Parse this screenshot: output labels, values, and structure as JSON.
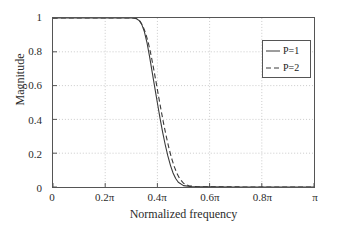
{
  "chart_data": {
    "type": "line",
    "title": "",
    "xlabel": "Normalized frequency",
    "ylabel": "Magnitude",
    "xlim": [
      0,
      1
    ],
    "ylim": [
      0,
      1
    ],
    "grid": true,
    "grid_style": "dotted",
    "legend_position": "upper right",
    "xticks": [
      0,
      0.2,
      0.4,
      0.6,
      0.8,
      1.0
    ],
    "xticklabels": [
      "0",
      "0.2π",
      "0.4π",
      "0.6π",
      "0.8π",
      "π"
    ],
    "yticks": [
      0,
      0.2,
      0.4,
      0.6,
      0.8,
      1.0
    ],
    "yticklabels": [
      "0",
      "0.2",
      "0.4",
      "0.6",
      "0.8",
      "1"
    ],
    "series": [
      {
        "name": "P=1",
        "style": "solid",
        "color": "#3a3a3a",
        "x": [
          0.0,
          0.02,
          0.04,
          0.06,
          0.08,
          0.1,
          0.12,
          0.14,
          0.16,
          0.18,
          0.2,
          0.22,
          0.24,
          0.26,
          0.275,
          0.29,
          0.3,
          0.31,
          0.32,
          0.33,
          0.34,
          0.35,
          0.36,
          0.37,
          0.38,
          0.39,
          0.4,
          0.41,
          0.42,
          0.43,
          0.44,
          0.45,
          0.46,
          0.47,
          0.48,
          0.5,
          0.53,
          0.56,
          0.6,
          0.7,
          0.8,
          0.9,
          1.0
        ],
        "y": [
          1.0,
          1.0,
          1.0,
          1.0,
          1.0,
          1.0,
          1.0,
          1.0,
          1.0,
          1.0,
          1.0,
          1.0,
          1.0,
          1.0,
          1.0,
          1.0,
          1.0,
          0.999,
          0.995,
          0.985,
          0.962,
          0.92,
          0.855,
          0.772,
          0.68,
          0.588,
          0.497,
          0.408,
          0.325,
          0.25,
          0.184,
          0.128,
          0.083,
          0.05,
          0.028,
          0.008,
          0.002,
          0.001,
          0.0005,
          0.0003,
          0.0002,
          0.0002,
          0.0001
        ]
      },
      {
        "name": "P=2",
        "style": "dashed",
        "color": "#3a3a3a",
        "x": [
          0.0,
          0.02,
          0.04,
          0.06,
          0.08,
          0.1,
          0.12,
          0.14,
          0.16,
          0.18,
          0.2,
          0.22,
          0.24,
          0.26,
          0.28,
          0.295,
          0.305,
          0.315,
          0.325,
          0.335,
          0.345,
          0.355,
          0.365,
          0.375,
          0.385,
          0.395,
          0.405,
          0.415,
          0.425,
          0.435,
          0.445,
          0.455,
          0.465,
          0.475,
          0.485,
          0.5,
          0.52,
          0.55,
          0.6,
          0.7,
          0.8,
          0.9,
          1.0
        ],
        "y": [
          1.0,
          1.0,
          1.0,
          1.0,
          1.0,
          1.0,
          1.0,
          1.0,
          1.0,
          1.0,
          1.0,
          1.0,
          1.0,
          1.0,
          1.002,
          1.008,
          1.01,
          1.006,
          0.995,
          0.978,
          0.95,
          0.91,
          0.855,
          0.785,
          0.705,
          0.62,
          0.532,
          0.447,
          0.366,
          0.292,
          0.225,
          0.167,
          0.119,
          0.08,
          0.051,
          0.022,
          0.007,
          0.002,
          0.001,
          0.0005,
          0.0003,
          0.0002,
          0.0001
        ]
      }
    ]
  },
  "axes": {
    "xlabel": "Normalized frequency",
    "ylabel": "Magnitude",
    "xticklabels": [
      "0",
      "0.2π",
      "0.4π",
      "0.6π",
      "0.8π",
      "π"
    ],
    "yticklabels": [
      "0",
      "0.2",
      "0.4",
      "0.6",
      "0.8",
      "1"
    ]
  },
  "legend": {
    "items": [
      {
        "label": "P=1",
        "style": "solid"
      },
      {
        "label": "P=2",
        "style": "dashed"
      }
    ]
  },
  "colors": {
    "curve": "#3a3a3a",
    "axis": "#555555",
    "grid": "#bdbdbd",
    "background": "#ffffff",
    "text": "#2b2b2b"
  }
}
